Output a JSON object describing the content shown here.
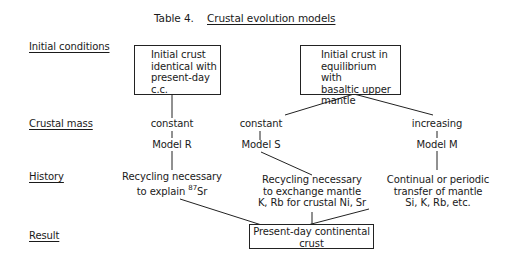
{
  "title": {
    "table_label": "Table 4.",
    "caption": "Crustal evolution models"
  },
  "row_labels": {
    "initial_conditions": "Initial conditions",
    "crustal_mass": "Crustal mass",
    "history": "History",
    "result": "Result"
  },
  "initial": {
    "left_box": [
      "Initial crust",
      "identical with",
      "present-day",
      "c.c."
    ],
    "right_box": [
      "Initial crust in",
      "equilibrium with",
      "basaltic upper",
      "mantle"
    ]
  },
  "crustal_mass": {
    "model_r": "constant",
    "model_s": "constant",
    "model_m": "increasing"
  },
  "models": {
    "r": "Model R",
    "s": "Model S",
    "m": "Model M"
  },
  "history": {
    "r": {
      "line1": "Recycling necessary",
      "line2_prefix": "to explain ",
      "isotope_mass": "87",
      "isotope_symbol": "Sr"
    },
    "s": {
      "line1": "Recycling necessary",
      "line2": "to exchange mantle",
      "line3": "K, Rb for crustal Ni, Sr"
    },
    "m": {
      "line1": "Continual or periodic",
      "line2": "transfer of mantle",
      "line3": "Si, K, Rb, etc."
    }
  },
  "result": {
    "box": [
      "Present-day continental",
      "crust"
    ]
  }
}
